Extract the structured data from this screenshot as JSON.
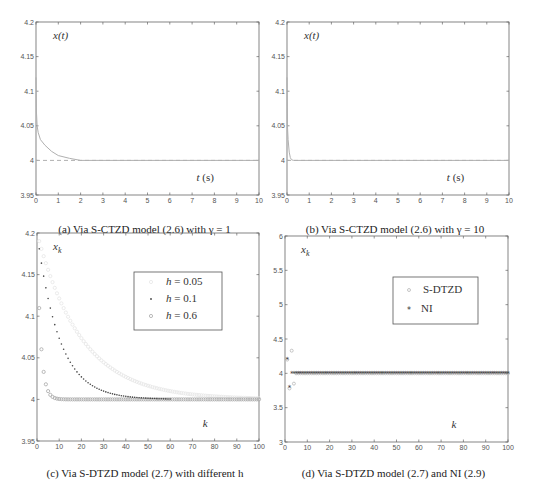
{
  "chart_data": [
    {
      "id": "a",
      "type": "line",
      "caption": "(a) Via S-CTZD model (2.6) with γ = 1",
      "ylabel": "x(t)",
      "xlabel": "t (s)",
      "xlim": [
        0,
        10
      ],
      "ylim": [
        3.95,
        4.2
      ],
      "xticks": [
        "0",
        "1",
        "2",
        "3",
        "4",
        "5",
        "6",
        "7",
        "8",
        "9",
        "10"
      ],
      "yticks": [
        "3.95",
        "4",
        "4.05",
        "4.1",
        "4.15",
        "4.2"
      ],
      "series": [
        {
          "name": "x(t)",
          "style": "solid",
          "color": "#b0b0b0",
          "x": [
            0,
            0.02,
            0.05,
            0.1,
            0.2,
            0.4,
            0.7,
            1.0,
            1.5,
            2.0,
            3.0,
            10
          ],
          "y": [
            4.12,
            4.07,
            4.05,
            4.04,
            4.03,
            4.022,
            4.013,
            4.007,
            4.003,
            4.0,
            4.0,
            4.0
          ]
        },
        {
          "name": "target",
          "style": "dashed",
          "color": "#b0b0b0",
          "x": [
            0,
            10
          ],
          "y": [
            4.0,
            4.0
          ]
        }
      ]
    },
    {
      "id": "b",
      "type": "line",
      "caption": "(b) Via S-CTZD model (2.6) with γ = 10",
      "ylabel": "x(t)",
      "xlabel": "t (s)",
      "xlim": [
        0,
        10
      ],
      "ylim": [
        3.95,
        4.2
      ],
      "xticks": [
        "0",
        "1",
        "2",
        "3",
        "4",
        "5",
        "6",
        "7",
        "8",
        "9",
        "10"
      ],
      "yticks": [
        "3.95",
        "4",
        "4.05",
        "4.1",
        "4.15",
        "4.2"
      ],
      "series": [
        {
          "name": "x(t)",
          "style": "solid",
          "color": "#b0b0b0",
          "x": [
            0,
            0.02,
            0.05,
            0.1,
            0.15,
            0.2,
            0.3,
            10
          ],
          "y": [
            4.12,
            4.05,
            4.03,
            4.012,
            4.004,
            4.001,
            4.0,
            4.0
          ]
        },
        {
          "name": "target",
          "style": "dashed",
          "color": "#b0b0b0",
          "x": [
            0,
            10
          ],
          "y": [
            4.0,
            4.0
          ]
        }
      ]
    },
    {
      "id": "c",
      "type": "scatter",
      "caption": "(c) Via S-DTZD model (2.7) with different h",
      "ylabel": "x_k",
      "xlabel": "k",
      "xlim": [
        0,
        100
      ],
      "ylim": [
        3.95,
        4.2
      ],
      "xticks": [
        "0",
        "10",
        "20",
        "30",
        "40",
        "50",
        "60",
        "70",
        "80",
        "90",
        "100"
      ],
      "yticks": [
        "3.95",
        "4",
        "4.05",
        "4.1",
        "4.15",
        "4.2"
      ],
      "legend": {
        "position": "top-right",
        "entries": [
          "h = 0.05",
          "h = 0.1",
          "h = 0.6"
        ]
      },
      "series": [
        {
          "name": "h = 0.05",
          "marker": "o",
          "color": "#e6e6e6",
          "x0": 4.2,
          "target": 4.0,
          "h": 0.05,
          "k_start": 1,
          "k_end": 100
        },
        {
          "name": "h = 0.1",
          "marker": ".",
          "color": "#444444",
          "x0": 4.2,
          "target": 4.0,
          "h": 0.1,
          "k_start": 1,
          "k_end": 60
        },
        {
          "name": "h = 0.6",
          "marker": "o",
          "color": "#a8a8a8",
          "x0": 4.2,
          "target": 4.0,
          "h": 0.6,
          "k_start": 1,
          "k_end": 100
        }
      ]
    },
    {
      "id": "d",
      "type": "scatter",
      "caption": "(d) Via S-DTZD model (2.7) and NI (2.9)",
      "ylabel": "x_k",
      "xlabel": "k",
      "xlim": [
        0,
        100
      ],
      "ylim": [
        3,
        6
      ],
      "xticks": [
        "0",
        "10",
        "20",
        "30",
        "40",
        "50",
        "60",
        "70",
        "80",
        "90",
        "100"
      ],
      "yticks": [
        "3",
        "3.5",
        "4",
        "4.5",
        "5",
        "5.5",
        "6"
      ],
      "legend": {
        "position": "top-right",
        "entries": [
          "S-DTZD",
          "NI"
        ]
      },
      "series": [
        {
          "name": "S-DTZD",
          "marker": "o",
          "color": "#b8b8b8",
          "x": [
            1,
            2,
            3,
            4
          ],
          "y": [
            4.2,
            3.78,
            4.33,
            3.85
          ],
          "steady_from": 5,
          "steady_value": 4.0
        },
        {
          "name": "NI",
          "marker": "*",
          "color": "#333333",
          "x": [
            1,
            2
          ],
          "y": [
            4.2,
            3.8
          ],
          "steady_from": 3,
          "steady_value": 4.0
        }
      ]
    }
  ]
}
